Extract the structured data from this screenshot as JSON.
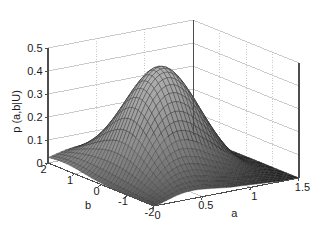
{
  "chart_data": {
    "type": "surface",
    "title": "",
    "xlabel": "a",
    "ylabel": "b",
    "zlabel": "p (a,b|U)",
    "xlim": [
      0,
      1.5
    ],
    "ylim": [
      -2,
      2
    ],
    "zlim": [
      0,
      0.5
    ],
    "xticks": [
      "0",
      "0.5",
      "1",
      "1.5"
    ],
    "xtick_values": [
      0,
      0.5,
      1,
      1.5
    ],
    "yticks": [
      "2",
      "1",
      "0",
      "-1",
      "-2"
    ],
    "ytick_values": [
      2,
      1,
      0,
      -1,
      -2
    ],
    "zticks": [
      "0",
      "0.1",
      "0.2",
      "0.3",
      "0.4",
      "0.5"
    ],
    "ztick_values": [
      0,
      0.1,
      0.2,
      0.3,
      0.4,
      0.5
    ],
    "grid": true,
    "legend": "none",
    "colormap": "grayscale",
    "mesh_color_light": "#e8e8e8",
    "mesh_color_dark": "#2a2a2a",
    "mesh_line_color": "#3a3a3a",
    "axis_color": "#4d4d4d",
    "grid_color": "#b4b4b4",
    "background": "#ffffff",
    "peak_value": 0.44,
    "peak_at": {
      "a": 0.45,
      "b": 0.1
    },
    "surface_samples": {
      "a_grid": [
        0.0,
        0.075,
        0.15,
        0.225,
        0.3,
        0.375,
        0.45,
        0.525,
        0.6,
        0.675,
        0.75,
        0.825,
        0.9,
        0.975,
        1.05,
        1.125,
        1.2,
        1.275,
        1.35,
        1.425,
        1.5
      ],
      "b_grid": [
        2.0,
        1.8,
        1.6,
        1.4,
        1.2,
        1.0,
        0.8,
        0.6,
        0.4,
        0.2,
        0.0,
        -0.2,
        -0.4,
        -0.6,
        -0.8,
        -1.0,
        -1.2,
        -1.4,
        -1.6,
        -1.8,
        -2.0
      ],
      "note": "z = p(a,b|U) evaluated on the 21x21 grid above"
    }
  },
  "axes": {
    "z_axis_name": "p (a,b|U)",
    "x_axis_name": "a",
    "y_axis_name": "b"
  }
}
